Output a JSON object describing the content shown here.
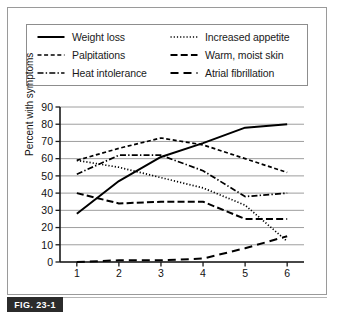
{
  "figure": {
    "number_label": "FIG. 23-1"
  },
  "legend": {
    "entries": [
      {
        "label": "Weight loss",
        "style": "solid",
        "icon": "line-solid-icon"
      },
      {
        "label": "Increased appetite",
        "style": "dotted",
        "icon": "line-dotted-icon"
      },
      {
        "label": "Palpitations",
        "style": "short-dash",
        "icon": "line-short-dash-icon"
      },
      {
        "label": "Warm, moist skin",
        "style": "medium-dash",
        "icon": "line-medium-dash-icon"
      },
      {
        "label": "Heat intolerance",
        "style": "dash-dot",
        "icon": "line-dash-dot-icon"
      },
      {
        "label": "Atrial fibrillation",
        "style": "long-dash",
        "icon": "line-long-dash-icon"
      }
    ]
  },
  "chart_data": {
    "type": "line",
    "title": "",
    "xlabel": "Age in decades",
    "ylabel": "Percent with symptoms",
    "x": [
      1,
      2,
      3,
      4,
      5,
      6
    ],
    "categories": [
      "1",
      "2",
      "3",
      "4",
      "5",
      "6"
    ],
    "xlim": [
      0.6,
      6.4
    ],
    "ylim": [
      0,
      90
    ],
    "yticks": [
      0,
      10,
      20,
      30,
      40,
      50,
      60,
      70,
      80,
      90
    ],
    "xticks": [
      1,
      2,
      3,
      4,
      5,
      6
    ],
    "grid": "horizontal",
    "legend_position": "above-plot",
    "series": [
      {
        "name": "Weight loss",
        "style": "solid",
        "values": [
          28,
          47,
          61,
          69,
          78,
          80
        ]
      },
      {
        "name": "Increased appetite",
        "style": "dotted",
        "values": [
          59,
          55,
          49,
          43,
          33,
          12
        ]
      },
      {
        "name": "Palpitations",
        "style": "short-dash",
        "values": [
          59,
          66,
          72,
          68,
          60,
          52
        ]
      },
      {
        "name": "Warm, moist skin",
        "style": "medium-dash",
        "values": [
          40,
          34,
          35,
          35,
          25,
          25
        ]
      },
      {
        "name": "Heat intolerance",
        "style": "dash-dot",
        "values": [
          51,
          62,
          62,
          53,
          38,
          40
        ]
      },
      {
        "name": "Atrial fibrillation",
        "style": "long-dash",
        "values": [
          0,
          1,
          1,
          2,
          8,
          15
        ]
      }
    ]
  },
  "colors": {
    "line": "#000000",
    "grid": "#9e9e9e",
    "axis": "#1a1a1a",
    "frame": "#9a9a9a",
    "badge_bg": "#2b2b2b",
    "badge_text": "#ffffff",
    "background": "#ffffff"
  }
}
